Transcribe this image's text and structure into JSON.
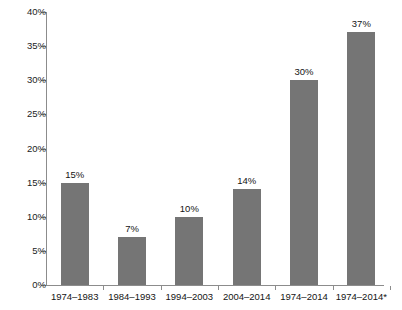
{
  "chart_data": {
    "type": "bar",
    "title": "",
    "subtitle": "",
    "xlabel": "",
    "ylabel": "",
    "ylim": [
      0,
      40
    ],
    "ytick_labels": [
      "0%",
      "5%",
      "10%",
      "15%",
      "20%",
      "25%",
      "30%",
      "35%",
      "40%"
    ],
    "ytick_values": [
      0,
      5,
      10,
      15,
      20,
      25,
      30,
      35,
      40
    ],
    "grid": false,
    "legend": null,
    "categories": [
      "1974–1983",
      "1984–1993",
      "1994–2003",
      "2004–2014",
      "1974–2014",
      "1974–2014*"
    ],
    "values": [
      15,
      7,
      10,
      14,
      30,
      37
    ],
    "data_labels": [
      "15%",
      "7%",
      "10%",
      "14%",
      "30%",
      "37%"
    ],
    "bar_color": "#757575",
    "axis_color": "#8c8c8c",
    "background_color": "#ffffff",
    "annotations": []
  }
}
